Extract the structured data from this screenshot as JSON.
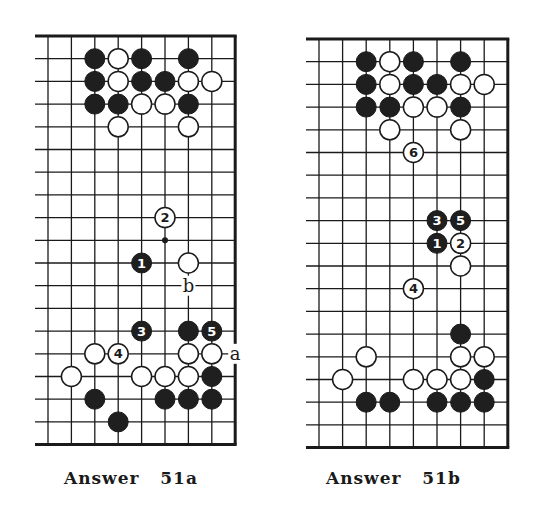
{
  "colors": {
    "ink": "#1a1a1a",
    "black_stone": "#1f1f1f",
    "white_stone": "#ffffff",
    "paper": "#ffffff"
  },
  "diagrams": [
    {
      "id": "51a",
      "caption": "Answer   51a",
      "origin": {
        "x": 48,
        "y": 36
      },
      "grid": {
        "cols": 8,
        "rows": 19,
        "col_spacing": 23.4,
        "row_spacing": 22.7,
        "right_edge_col": 8,
        "top_edge_row": 0,
        "bottom_edge_row": 18,
        "left_open": true
      },
      "stones": [
        {
          "c": 2,
          "r": 1,
          "color": "black"
        },
        {
          "c": 3,
          "r": 1,
          "color": "white"
        },
        {
          "c": 4,
          "r": 1,
          "color": "black"
        },
        {
          "c": 6,
          "r": 1,
          "color": "black"
        },
        {
          "c": 2,
          "r": 2,
          "color": "black"
        },
        {
          "c": 3,
          "r": 2,
          "color": "white"
        },
        {
          "c": 4,
          "r": 2,
          "color": "black"
        },
        {
          "c": 5,
          "r": 2,
          "color": "black"
        },
        {
          "c": 6,
          "r": 2,
          "color": "white"
        },
        {
          "c": 7,
          "r": 2,
          "color": "white"
        },
        {
          "c": 2,
          "r": 3,
          "color": "black"
        },
        {
          "c": 3,
          "r": 3,
          "color": "black"
        },
        {
          "c": 4,
          "r": 3,
          "color": "white"
        },
        {
          "c": 5,
          "r": 3,
          "color": "white"
        },
        {
          "c": 6,
          "r": 3,
          "color": "black"
        },
        {
          "c": 3,
          "r": 4,
          "color": "white"
        },
        {
          "c": 6,
          "r": 4,
          "color": "white"
        },
        {
          "c": 5,
          "r": 8,
          "color": "white",
          "number": "2"
        },
        {
          "c": 4,
          "r": 10,
          "color": "black",
          "number": "1"
        },
        {
          "c": 6,
          "r": 10,
          "color": "white"
        },
        {
          "c": 4,
          "r": 13,
          "color": "black",
          "number": "3"
        },
        {
          "c": 6,
          "r": 13,
          "color": "black"
        },
        {
          "c": 7,
          "r": 13,
          "color": "black",
          "number": "5"
        },
        {
          "c": 2,
          "r": 14,
          "color": "white"
        },
        {
          "c": 3,
          "r": 14,
          "color": "white",
          "number": "4"
        },
        {
          "c": 6,
          "r": 14,
          "color": "white"
        },
        {
          "c": 7,
          "r": 14,
          "color": "white"
        },
        {
          "c": 1,
          "r": 15,
          "color": "white"
        },
        {
          "c": 4,
          "r": 15,
          "color": "white"
        },
        {
          "c": 5,
          "r": 15,
          "color": "white"
        },
        {
          "c": 6,
          "r": 15,
          "color": "white"
        },
        {
          "c": 7,
          "r": 15,
          "color": "black"
        },
        {
          "c": 2,
          "r": 16,
          "color": "black"
        },
        {
          "c": 5,
          "r": 16,
          "color": "black"
        },
        {
          "c": 6,
          "r": 16,
          "color": "black"
        },
        {
          "c": 7,
          "r": 16,
          "color": "black"
        },
        {
          "c": 3,
          "r": 17,
          "color": "black"
        }
      ],
      "markers": [
        {
          "c": 5,
          "r": 9,
          "type": "dot"
        }
      ],
      "labels": [
        {
          "c": 6,
          "r": 11,
          "text": "b"
        },
        {
          "c": 8,
          "r": 14,
          "text": "a"
        }
      ]
    },
    {
      "id": "51b",
      "caption": "Answer   51b",
      "origin": {
        "x": 319,
        "y": 39
      },
      "grid": {
        "cols": 8,
        "rows": 19,
        "col_spacing": 23.6,
        "row_spacing": 22.7,
        "right_edge_col": 8,
        "top_edge_row": 0,
        "bottom_edge_row": 18,
        "left_open": true
      },
      "stones": [
        {
          "c": 2,
          "r": 1,
          "color": "black"
        },
        {
          "c": 3,
          "r": 1,
          "color": "white"
        },
        {
          "c": 4,
          "r": 1,
          "color": "black"
        },
        {
          "c": 6,
          "r": 1,
          "color": "black"
        },
        {
          "c": 2,
          "r": 2,
          "color": "black"
        },
        {
          "c": 3,
          "r": 2,
          "color": "white"
        },
        {
          "c": 4,
          "r": 2,
          "color": "black"
        },
        {
          "c": 5,
          "r": 2,
          "color": "black"
        },
        {
          "c": 6,
          "r": 2,
          "color": "white"
        },
        {
          "c": 7,
          "r": 2,
          "color": "white"
        },
        {
          "c": 2,
          "r": 3,
          "color": "black"
        },
        {
          "c": 3,
          "r": 3,
          "color": "black"
        },
        {
          "c": 4,
          "r": 3,
          "color": "white"
        },
        {
          "c": 5,
          "r": 3,
          "color": "white"
        },
        {
          "c": 6,
          "r": 3,
          "color": "black"
        },
        {
          "c": 3,
          "r": 4,
          "color": "white"
        },
        {
          "c": 6,
          "r": 4,
          "color": "white"
        },
        {
          "c": 4,
          "r": 5,
          "color": "white",
          "number": "6"
        },
        {
          "c": 5,
          "r": 8,
          "color": "black",
          "number": "3"
        },
        {
          "c": 6,
          "r": 8,
          "color": "black",
          "number": "5"
        },
        {
          "c": 5,
          "r": 9,
          "color": "black",
          "number": "1"
        },
        {
          "c": 6,
          "r": 9,
          "color": "white",
          "number": "2"
        },
        {
          "c": 6,
          "r": 10,
          "color": "white"
        },
        {
          "c": 4,
          "r": 11,
          "color": "white",
          "number": "4"
        },
        {
          "c": 6,
          "r": 13,
          "color": "black"
        },
        {
          "c": 2,
          "r": 14,
          "color": "white"
        },
        {
          "c": 6,
          "r": 14,
          "color": "white"
        },
        {
          "c": 7,
          "r": 14,
          "color": "white"
        },
        {
          "c": 1,
          "r": 15,
          "color": "white"
        },
        {
          "c": 4,
          "r": 15,
          "color": "white"
        },
        {
          "c": 5,
          "r": 15,
          "color": "white"
        },
        {
          "c": 6,
          "r": 15,
          "color": "white"
        },
        {
          "c": 7,
          "r": 15,
          "color": "black"
        },
        {
          "c": 2,
          "r": 16,
          "color": "black"
        },
        {
          "c": 3,
          "r": 16,
          "color": "black"
        },
        {
          "c": 5,
          "r": 16,
          "color": "black"
        },
        {
          "c": 6,
          "r": 16,
          "color": "black"
        },
        {
          "c": 7,
          "r": 16,
          "color": "black"
        }
      ],
      "markers": [],
      "labels": []
    }
  ]
}
